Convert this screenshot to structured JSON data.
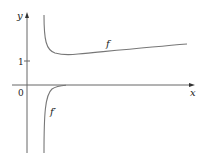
{
  "figure": {
    "axes": {
      "x_label": "x",
      "y_label": "y",
      "origin_label": "0",
      "y_tick_label": "1"
    },
    "curves": [
      {
        "name": "f",
        "label": "f",
        "description": "decreases sharply from vertical asymptote near y-axis, minimum slightly above 1, then slowly increases"
      },
      {
        "name": "f-prime",
        "label": "f′",
        "description": "rises from negative infinity near vertical asymptote, approaches 0 from below"
      }
    ],
    "colors": {
      "axis": "#555555",
      "curve": "#666666",
      "text": "#222222"
    }
  }
}
